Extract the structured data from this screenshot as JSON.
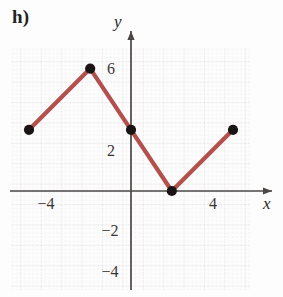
{
  "figure": {
    "part_label": "h)"
  },
  "chart_data": {
    "type": "line",
    "title": "",
    "xlabel": "x",
    "ylabel": "y",
    "xlim": [
      -5.9,
      5.9
    ],
    "ylim": [
      -5.9,
      7.0
    ],
    "grid": true,
    "grid_major_step": 2,
    "grid_minor_step": 0.4,
    "legend": "none",
    "line_color": "#b3504c",
    "marker_color": "#1a1414",
    "marker_style": "filled-circle",
    "x": [
      -5,
      -2,
      0,
      2,
      5
    ],
    "y": [
      3,
      6,
      3,
      0,
      3
    ],
    "points": [
      {
        "x": -5,
        "y": 3
      },
      {
        "x": -2,
        "y": 6
      },
      {
        "x": 0,
        "y": 3
      },
      {
        "x": 2,
        "y": 0
      },
      {
        "x": 5,
        "y": 3
      }
    ],
    "xticks": [
      -4,
      4
    ],
    "xtick_labels": [
      "−4",
      "4"
    ],
    "yticks": [
      6,
      2,
      -2,
      -4
    ],
    "ytick_labels": [
      "6",
      "2",
      "−2",
      "−4"
    ]
  },
  "axes": {
    "x_name": "x",
    "y_name": "y"
  }
}
